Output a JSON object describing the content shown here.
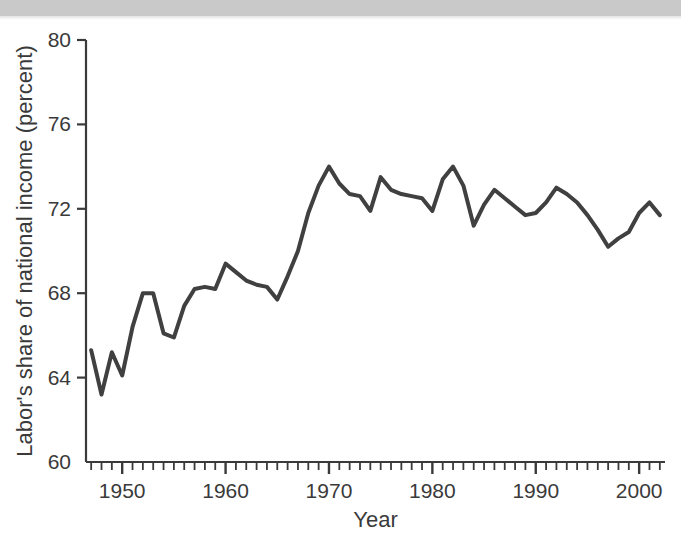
{
  "chart_data": {
    "type": "line",
    "title": "",
    "xlabel": "Year",
    "ylabel": "Labor's share of national income (percent)",
    "xlim": [
      1946.5,
      2002.5
    ],
    "ylim": [
      60,
      80
    ],
    "xticks": [
      1950,
      1960,
      1970,
      1980,
      1990,
      2000
    ],
    "xtick_labels": [
      "1950",
      "1960",
      "1970",
      "1980",
      "1990",
      "2000"
    ],
    "yticks": [
      60,
      64,
      68,
      72,
      76,
      80
    ],
    "ytick_labels": [
      "60",
      "64",
      "68",
      "72",
      "76",
      "80"
    ],
    "minor_xtick_interval": 1,
    "grid": false,
    "legend": false,
    "legend_position": "none",
    "line_color": "#404040",
    "line_width": 4,
    "axis_color": "#3a3a3a",
    "background_color": "#ffffff",
    "series": [
      {
        "name": "Labor's share of national income",
        "x": [
          1947,
          1948,
          1949,
          1950,
          1951,
          1952,
          1953,
          1954,
          1955,
          1956,
          1957,
          1958,
          1959,
          1960,
          1961,
          1962,
          1963,
          1964,
          1965,
          1966,
          1967,
          1968,
          1969,
          1970,
          1971,
          1972,
          1973,
          1974,
          1975,
          1976,
          1977,
          1978,
          1979,
          1980,
          1981,
          1982,
          1983,
          1984,
          1985,
          1986,
          1987,
          1988,
          1989,
          1990,
          1991,
          1992,
          1993,
          1994,
          1995,
          1996,
          1997,
          1998,
          1999,
          2000,
          2001,
          2002
        ],
        "values": [
          65.3,
          63.2,
          65.2,
          64.1,
          66.4,
          68.0,
          68.0,
          66.1,
          65.9,
          67.4,
          68.2,
          68.3,
          68.2,
          69.4,
          69.0,
          68.6,
          68.4,
          68.3,
          67.7,
          68.8,
          70.0,
          71.8,
          73.1,
          74.0,
          73.2,
          72.7,
          72.6,
          71.9,
          73.5,
          72.9,
          72.7,
          72.6,
          72.5,
          71.9,
          73.4,
          74.0,
          73.1,
          71.2,
          72.2,
          72.9,
          72.5,
          72.1,
          71.7,
          71.8,
          72.3,
          73.0,
          72.7,
          72.3,
          71.7,
          71.0,
          70.2,
          70.6,
          70.9,
          71.8,
          72.3,
          71.7
        ]
      }
    ]
  },
  "figure": {
    "source_band_label": ""
  }
}
